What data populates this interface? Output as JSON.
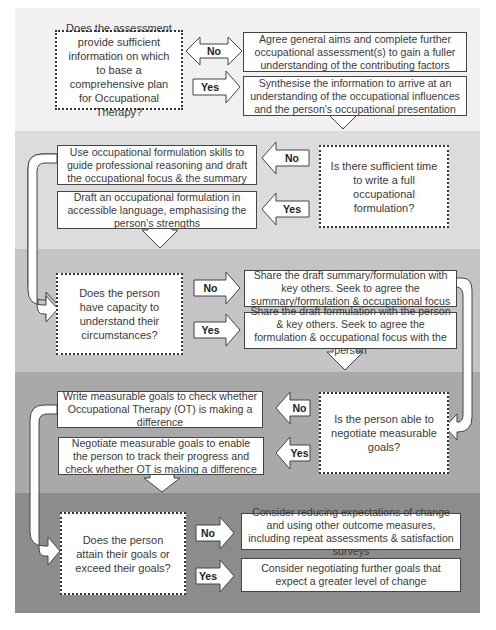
{
  "colors": {
    "band1": "#f1f1f1",
    "band2": "#dcdcdc",
    "band3": "#c4c4c4",
    "band4": "#a8a8a8",
    "band5": "#8c8c8c",
    "box_fill": "#ffffff",
    "border": "#444444"
  },
  "sections": [
    {
      "decision": "Does the assessment provide sufficient information on which to base a comprehensive plan for Occupational Therapy?",
      "no_label": "No",
      "no_outcome": "Agree general aims and complete further occupational assessment(s) to gain a fuller understanding of the contributing factors",
      "yes_label": "Yes",
      "yes_outcome": "Synthesise the information to arrive at an understanding of the occupational influences and the person's occupational presentation"
    },
    {
      "decision": "Is there sufficient time to write a full occupational formulation?",
      "no_label": "No",
      "no_outcome": "Use occupational formulation skills to guide professional reasoning and draft the occupational focus & the summary",
      "yes_label": "Yes",
      "yes_outcome": "Draft an occupational formulation in accessible language, emphasising the person's strengths"
    },
    {
      "decision": "Does the person have capacity to understand their circumstances?",
      "no_label": "No",
      "no_outcome": "Share the draft summary/formulation with key others. Seek to agree the summary/formulation & occupational focus",
      "yes_label": "Yes",
      "yes_outcome": "Share the draft formulation with the person & key others. Seek to agree the formulation & occupational focus with the person"
    },
    {
      "decision": "Is the person able to negotiate measurable goals?",
      "no_label": "No",
      "no_outcome": "Write measurable goals to check whether Occupational Therapy (OT) is making a difference",
      "yes_label": "Yes",
      "yes_outcome": "Negotiate measurable goals to enable the person to track their progress and check whether OT is making a difference"
    },
    {
      "decision": "Does the person attain their goals or exceed their goals?",
      "no_label": "No",
      "no_outcome": "Consider reducing expectations of change and using other outcome measures, including repeat assessments & satisfaction surveys",
      "yes_label": "Yes",
      "yes_outcome": "Consider negotiating further goals that expect a greater level of change"
    }
  ]
}
